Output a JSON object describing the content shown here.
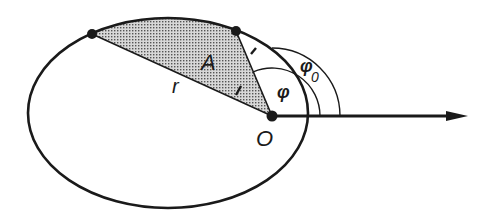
{
  "diagram": {
    "type": "orbital-geometry",
    "labels": {
      "area": "A",
      "radius": "r",
      "focus": "O",
      "angle": "φ",
      "angle0": "φ",
      "angle0_sub": "0"
    },
    "colors": {
      "stroke": "#1a1a1a",
      "shade": "#8a8a8a",
      "background": "#ffffff"
    },
    "ellipse": {
      "cx": 168,
      "cy": 113,
      "rx": 140,
      "ry": 95
    },
    "points": [
      {
        "name": "orbit-point-1",
        "x": 92,
        "y": 34
      },
      {
        "name": "orbit-point-2",
        "x": 236,
        "y": 31
      },
      {
        "name": "focus-O",
        "x": 272,
        "y": 116
      }
    ],
    "arcs": [
      {
        "name": "phi-arc",
        "radius": 48
      },
      {
        "name": "phi0-arc",
        "radius": 68
      }
    ],
    "axis": {
      "x1": 272,
      "y1": 116,
      "x2": 468,
      "y2": 116
    }
  }
}
